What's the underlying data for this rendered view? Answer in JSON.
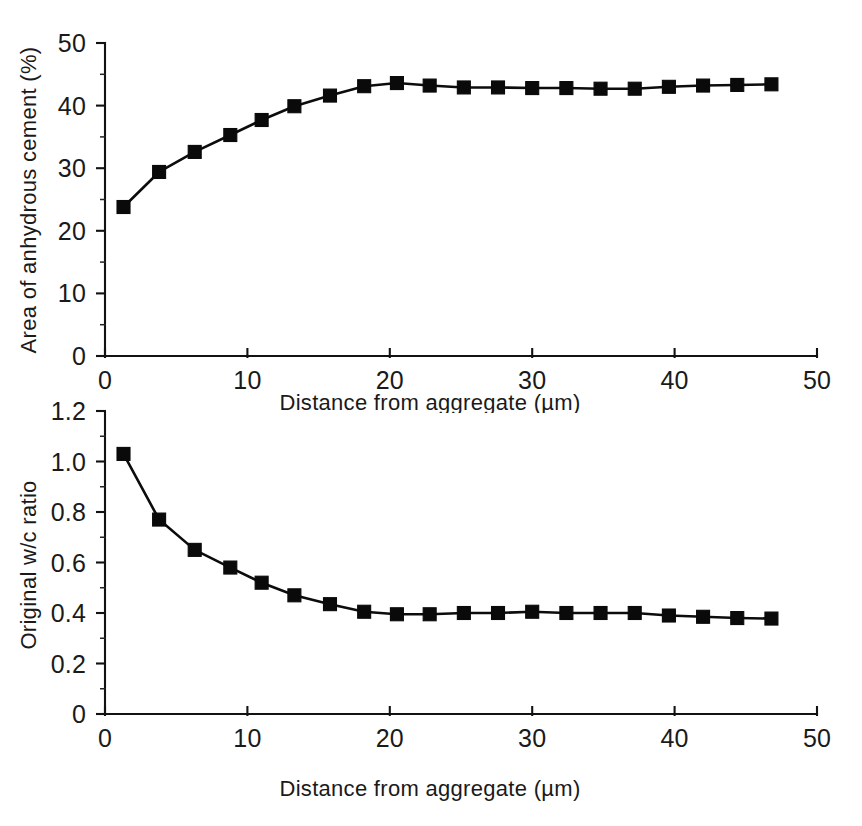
{
  "figure": {
    "name": "two-panel-line-chart",
    "background_color": "#ffffff",
    "ink_color": "#0c0c0c"
  },
  "chart_data": [
    {
      "panel": "top",
      "type": "line",
      "title": "",
      "subtitle": "",
      "xlabel": "Distance from aggregate (µm)",
      "ylabel": "Area of anhydrous cement (%)",
      "xlim": [
        0,
        50
      ],
      "ylim": [
        0,
        50
      ],
      "xticks": [
        0,
        10,
        20,
        30,
        40,
        50
      ],
      "xticklabels": [
        "0",
        "10",
        "20",
        "30",
        "40",
        "50"
      ],
      "yticks": [
        0,
        10,
        20,
        30,
        40,
        50
      ],
      "yticklabels": [
        "0",
        "10",
        "20",
        "30",
        "40",
        "50"
      ],
      "y_minor_ticks": [
        5,
        15,
        25,
        35,
        45
      ],
      "grid": false,
      "legend": false,
      "marker": "square",
      "x": [
        1.3,
        3.8,
        6.3,
        8.8,
        11.0,
        13.3,
        15.8,
        18.2,
        20.5,
        22.8,
        25.2,
        27.6,
        30.0,
        32.4,
        34.8,
        37.2,
        39.6,
        42.0,
        44.4,
        46.8
      ],
      "values": [
        23.8,
        29.4,
        32.6,
        35.3,
        37.7,
        39.9,
        41.6,
        43.1,
        43.6,
        43.2,
        42.9,
        42.9,
        42.8,
        42.8,
        42.7,
        42.7,
        43.0,
        43.2,
        43.3,
        43.4
      ]
    },
    {
      "panel": "bottom",
      "type": "line",
      "title": "",
      "subtitle": "",
      "xlabel": "Distance from aggregate (µm)",
      "ylabel": "Original w/c ratio",
      "xlim": [
        0,
        50
      ],
      "ylim": [
        0,
        1.2
      ],
      "xticks": [
        0,
        10,
        20,
        30,
        40,
        50
      ],
      "xticklabels": [
        "0",
        "10",
        "20",
        "30",
        "40",
        "50"
      ],
      "yticks": [
        0,
        0.2,
        0.4,
        0.6,
        0.8,
        1.0,
        1.2
      ],
      "yticklabels": [
        "0",
        "0.2",
        "0.4",
        "0.6",
        "0.8",
        "1.0",
        "1.2"
      ],
      "y_minor_ticks": [
        0.1,
        0.3,
        0.5,
        0.7,
        0.9,
        1.1
      ],
      "grid": false,
      "legend": false,
      "marker": "square",
      "x": [
        1.3,
        3.8,
        6.3,
        8.8,
        11.0,
        13.3,
        15.8,
        18.2,
        20.5,
        22.8,
        25.2,
        27.6,
        30.0,
        32.4,
        34.8,
        37.2,
        39.6,
        42.0,
        44.4,
        46.8
      ],
      "values": [
        1.03,
        0.77,
        0.65,
        0.58,
        0.52,
        0.47,
        0.435,
        0.405,
        0.395,
        0.395,
        0.4,
        0.4,
        0.405,
        0.4,
        0.4,
        0.4,
        0.39,
        0.385,
        0.38,
        0.378
      ]
    }
  ]
}
